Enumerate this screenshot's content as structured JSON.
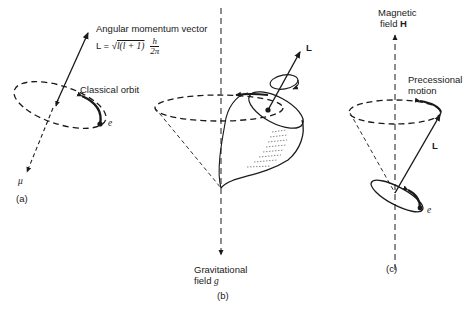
{
  "panels": {
    "a": {
      "caption": "(a)",
      "vector_title": "Angular momentum vector",
      "formula_lhs": "L = ",
      "formula_root_symbol": "√",
      "formula_root_body": "l(l + 1)",
      "formula_num": "h",
      "formula_den": "2π",
      "orbit_label": "Classical orbit",
      "electron_label": "e",
      "moment_label": "μ"
    },
    "b": {
      "caption": "(b)",
      "vector_label": "L",
      "field_label_line1": "Gravitational",
      "field_label_line2_text": "field ",
      "field_symbol": "g"
    },
    "c": {
      "caption": "(c)",
      "field_label_line1": "Magnetic",
      "field_label_line2_text": "field ",
      "field_symbol": "H",
      "motion_label_line1": "Precessional",
      "motion_label_line2": "motion",
      "vector_label": "L",
      "electron_label": "e"
    }
  },
  "colors": {
    "ink": "#1a1a1a",
    "background": "#ffffff"
  }
}
